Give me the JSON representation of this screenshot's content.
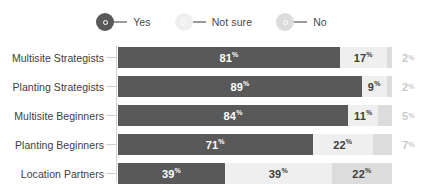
{
  "legend": {
    "items": [
      {
        "label": "Yes",
        "icon": "circle-marker-icon",
        "color": "#595959",
        "marker_fill": "#595959",
        "dash_color": "#9a9a9a",
        "inner_color": "#595959"
      },
      {
        "label": "Not sure",
        "icon": "circle-marker-icon",
        "color": "#efefef",
        "marker_fill": "#efefef",
        "dash_color": "#9a9a9a",
        "inner_color": "#efefef"
      },
      {
        "label": "No",
        "icon": "circle-marker-icon",
        "color": "#dcdcdc",
        "marker_fill": "#dcdcdc",
        "dash_color": "#9a9a9a",
        "inner_color": "#dcdcdc"
      }
    ]
  },
  "chart_data": {
    "type": "bar",
    "orientation": "horizontal",
    "stacked": true,
    "stacked_100": true,
    "title": "",
    "subtitle": "",
    "xlabel": "",
    "ylabel": "",
    "xlim": [
      0,
      100
    ],
    "grid": false,
    "legend_position": "top-center",
    "categories": [
      "Multisite Strategists",
      "Planting Strategists",
      "Multisite Beginners",
      "Planting Beginners",
      "Location Partners"
    ],
    "series": [
      {
        "name": "Yes",
        "color": "#595959",
        "label_color": "#ffffff",
        "values": [
          81,
          89,
          84,
          71,
          39
        ]
      },
      {
        "name": "Not sure",
        "color": "#efefef",
        "label_color": "#3d3d3d",
        "values": [
          17,
          9,
          11,
          22,
          39
        ]
      },
      {
        "name": "No",
        "color": "#dcdcdc",
        "label_color": "#3d3d3d",
        "values": [
          2,
          2,
          5,
          7,
          22
        ]
      }
    ],
    "data_label_suffix": "%",
    "rows": [
      {
        "category": "Multisite Strategists",
        "segments": [
          {
            "series": "Yes",
            "value": 81,
            "text": "81",
            "suffix": "%",
            "inside": true,
            "color": "#595959",
            "text_color": "#ffffff"
          },
          {
            "series": "Not sure",
            "value": 17,
            "text": "17",
            "suffix": "%",
            "inside": true,
            "color": "#efefef",
            "text_color": "#3d3d3d"
          },
          {
            "series": "No",
            "value": 2,
            "text": "2",
            "suffix": "%",
            "inside": false,
            "color": "#dcdcdc",
            "text_color": "#c9c9c9"
          }
        ]
      },
      {
        "category": "Planting Strategists",
        "segments": [
          {
            "series": "Yes",
            "value": 89,
            "text": "89",
            "suffix": "%",
            "inside": true,
            "color": "#595959",
            "text_color": "#ffffff"
          },
          {
            "series": "Not sure",
            "value": 9,
            "text": "9",
            "suffix": "%",
            "inside": true,
            "color": "#efefef",
            "text_color": "#3d3d3d"
          },
          {
            "series": "No",
            "value": 2,
            "text": "2",
            "suffix": "%",
            "inside": false,
            "color": "#dcdcdc",
            "text_color": "#c9c9c9"
          }
        ]
      },
      {
        "category": "Multisite Beginners",
        "segments": [
          {
            "series": "Yes",
            "value": 84,
            "text": "84",
            "suffix": "%",
            "inside": true,
            "color": "#595959",
            "text_color": "#ffffff"
          },
          {
            "series": "Not sure",
            "value": 11,
            "text": "11",
            "suffix": "%",
            "inside": true,
            "color": "#efefef",
            "text_color": "#3d3d3d"
          },
          {
            "series": "No",
            "value": 5,
            "text": "5",
            "suffix": "%",
            "inside": false,
            "color": "#dcdcdc",
            "text_color": "#c9c9c9"
          }
        ]
      },
      {
        "category": "Planting Beginners",
        "segments": [
          {
            "series": "Yes",
            "value": 71,
            "text": "71",
            "suffix": "%",
            "inside": true,
            "color": "#595959",
            "text_color": "#ffffff"
          },
          {
            "series": "Not sure",
            "value": 22,
            "text": "22",
            "suffix": "%",
            "inside": true,
            "color": "#efefef",
            "text_color": "#3d3d3d"
          },
          {
            "series": "No",
            "value": 7,
            "text": "7",
            "suffix": "%",
            "inside": false,
            "color": "#dcdcdc",
            "text_color": "#c9c9c9"
          }
        ]
      },
      {
        "category": "Location Partners",
        "segments": [
          {
            "series": "Yes",
            "value": 39,
            "text": "39",
            "suffix": "%",
            "inside": true,
            "color": "#595959",
            "text_color": "#ffffff"
          },
          {
            "series": "Not sure",
            "value": 39,
            "text": "39",
            "suffix": "%",
            "inside": true,
            "color": "#efefef",
            "text_color": "#3d3d3d"
          },
          {
            "series": "No",
            "value": 22,
            "text": "22",
            "suffix": "%",
            "inside": true,
            "color": "#dcdcdc",
            "text_color": "#3d3d3d"
          }
        ]
      }
    ]
  }
}
